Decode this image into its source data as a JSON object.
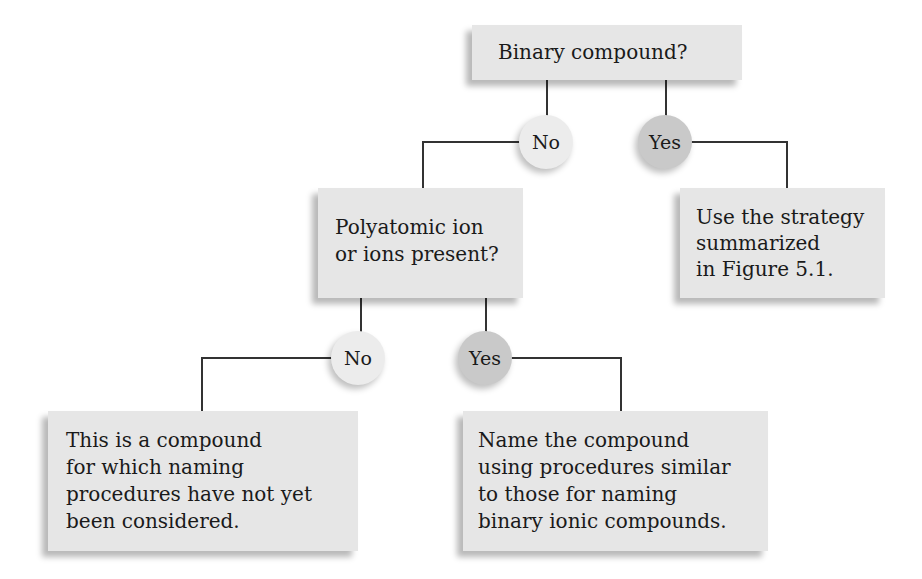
{
  "diagram": {
    "type": "flowchart",
    "colors": {
      "box_fill": "#e6e6e6",
      "no_circle_fill": "#ececec",
      "yes_circle_fill": "#c9c9c9",
      "connector": "#333333"
    },
    "nodes": {
      "binary_question": "Binary compound?",
      "no_1": "No",
      "yes_1": "Yes",
      "polyatomic_question": "Polyatomic ion\nor ions present?",
      "use_strategy": "Use the strategy\nsummarized\nin Figure 5.1.",
      "no_2": "No",
      "yes_2": "Yes",
      "not_considered": "This is a compound\nfor which naming\nprocedures have not yet\nbeen considered.",
      "name_compound": "Name the compound\nusing procedures similar\nto those for naming\nbinary ionic compounds."
    },
    "edges": [
      {
        "from": "binary_question",
        "to": "no_1"
      },
      {
        "from": "binary_question",
        "to": "yes_1"
      },
      {
        "from": "no_1",
        "to": "polyatomic_question"
      },
      {
        "from": "yes_1",
        "to": "use_strategy"
      },
      {
        "from": "polyatomic_question",
        "to": "no_2"
      },
      {
        "from": "polyatomic_question",
        "to": "yes_2"
      },
      {
        "from": "no_2",
        "to": "not_considered"
      },
      {
        "from": "yes_2",
        "to": "name_compound"
      }
    ]
  }
}
